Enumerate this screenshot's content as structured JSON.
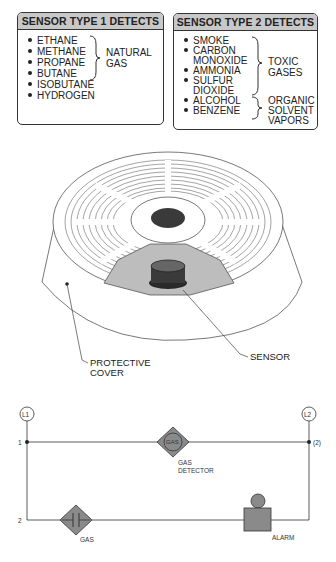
{
  "sensor_type_1": {
    "title": "SENSOR TYPE 1 DETECTS",
    "items": [
      "ETHANE",
      "METHANE",
      "PROPANE",
      "BUTANE",
      "ISOBUTANE",
      "HYDROGEN"
    ],
    "group_label_line1": "NATURAL",
    "group_label_line2": "GAS"
  },
  "sensor_type_2": {
    "title": "SENSOR TYPE 2 DETECTS",
    "items": [
      {
        "line1": "SMOKE"
      },
      {
        "line1": "CARBON",
        "line2": "MONOXIDE"
      },
      {
        "line1": "AMMONIA"
      },
      {
        "line1": "SULFUR",
        "line2": "DIOXIDE"
      },
      {
        "line1": "ALCOHOL"
      },
      {
        "line1": "BENZENE"
      }
    ],
    "group1_line1": "TOXIC",
    "group1_line2": "GASES",
    "group2_line1": "ORGANIC",
    "group2_line2": "SOLVENT",
    "group2_line3": "VAPORS"
  },
  "sensor_drawing": {
    "cover_label_line1": "PROTECTIVE",
    "cover_label_line2": "COVER",
    "sensor_label": "SENSOR"
  },
  "ladder_diagram": {
    "l1": "L1",
    "l2": "L2",
    "line1_number": "1",
    "line2_number": "2",
    "line1_ref": "(2)",
    "gas_detector_symbol": "GAS",
    "gas_detector_label_line1": "GAS",
    "gas_detector_label_line2": "DETECTOR",
    "gas_contact_label": "GAS",
    "alarm_label": "ALARM"
  },
  "colors": {
    "header_gray": "#c8c8c8",
    "symbol_gray": "#8a8a8a",
    "sensor_dark": "#3a3a3a",
    "shade_gray": "#bdbdbd"
  }
}
